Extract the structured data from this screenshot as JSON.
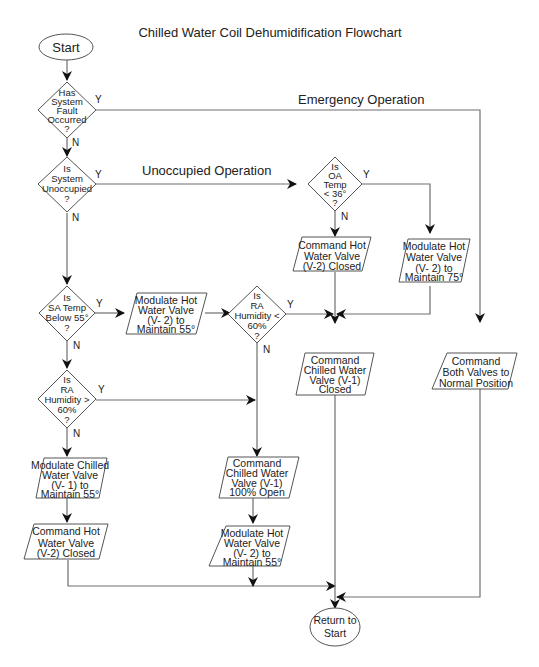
{
  "title": "Chilled Water Coil Dehumidification Flowchart",
  "section_labels": {
    "emergency": "Emergency Operation",
    "unoccupied": "Unoccupied Operation"
  },
  "terminals": {
    "start": "Start",
    "return": [
      "Return to",
      "Start"
    ]
  },
  "decisions": {
    "fault": [
      "Has",
      "System",
      "Fault",
      "Occurred",
      "?"
    ],
    "unoccupied": [
      "Is",
      "System",
      "Unoccupied",
      "?"
    ],
    "oa_temp": [
      "Is",
      "OA",
      "Temp",
      "< 36°",
      "?"
    ],
    "sa_temp": [
      "Is",
      "SA Temp",
      "Below  55°",
      "?"
    ],
    "ra_humidity_lt": [
      "Is",
      "RA",
      "Humidity <",
      "60%",
      "?"
    ],
    "ra_humidity_gt": [
      "Is",
      "RA",
      "Humidity >",
      "60%",
      "?"
    ]
  },
  "processes": {
    "hw_closed_unocc": [
      "Command Hot",
      "Water Valve",
      "(V-2)  Closed"
    ],
    "hw_75": [
      "Modulate Hot",
      "Water Valve",
      "(V- 2) to",
      "Maintain 75°"
    ],
    "hw_55_sa": [
      "Modulate Hot",
      "Water Valve",
      "(V- 2) to",
      "Maintain 55°"
    ],
    "cw_closed": [
      "Command",
      "Chilled Water",
      "Valve (V-1)",
      "Closed"
    ],
    "both_normal": [
      "Command",
      "Both Valves to",
      "Normal Position"
    ],
    "cw_55": [
      "Modulate Chilled",
      "Water Valve",
      "(V- 1) to",
      "Maintain 55°"
    ],
    "hw_closed": [
      "Command Hot",
      "Water Valve",
      "(V-2)  Closed"
    ],
    "cw_open": [
      "Command",
      "Chilled Water",
      "Valve (V-1)",
      "100% Open"
    ],
    "hw_55": [
      "Modulate Hot",
      "Water Valve",
      "(V- 2) to",
      "Maintain 55°"
    ]
  },
  "branch_labels": {
    "yes": "Y",
    "no": "N"
  }
}
